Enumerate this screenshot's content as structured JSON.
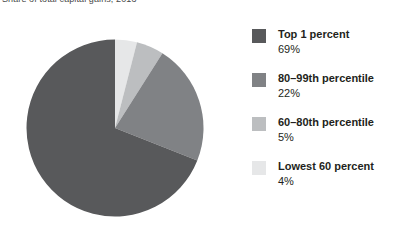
{
  "chart_data": {
    "type": "pie",
    "title": "Share of total capital gains, 2013",
    "xlabel": "",
    "ylabel": "",
    "legend_position": "right",
    "grid": false,
    "start_angle_deg": 0,
    "direction": "clockwise",
    "categories": [
      "Top 1 percent",
      "80–99th percentile",
      "60–80th percentile",
      "Lowest 60 percent"
    ],
    "values": [
      69,
      22,
      5,
      4
    ],
    "value_labels": [
      "69%",
      "22%",
      "5%",
      "4%"
    ],
    "unit": "percent",
    "colors": [
      "#58595b",
      "#808285",
      "#bcbec0",
      "#e6e7e8"
    ],
    "slices": [
      {
        "label": "Top 1 percent",
        "value": 69,
        "value_label": "69%",
        "color": "#58595b"
      },
      {
        "label": "80–99th percentile",
        "value": 22,
        "value_label": "22%",
        "color": "#808285"
      },
      {
        "label": "60–80th percentile",
        "value": 5,
        "value_label": "5%",
        "color": "#bcbec0"
      },
      {
        "label": "Lowest 60 percent",
        "value": 4,
        "value_label": "4%",
        "color": "#e6e7e8"
      }
    ]
  },
  "chart": {
    "title": "Share of total capital gains, 2013"
  },
  "legend": {
    "items": [
      {
        "label": "Top 1 percent",
        "value": "69%",
        "color": "#58595b",
        "name": "top-1-percent"
      },
      {
        "label": "80–99th percentile",
        "value": "22%",
        "color": "#808285",
        "name": "80-99th-percentile"
      },
      {
        "label": "60–80th percentile",
        "value": "5%",
        "color": "#bcbec0",
        "name": "60-80th-percentile"
      },
      {
        "label": "Lowest 60 percent",
        "value": "4%",
        "color": "#e6e7e8",
        "name": "lowest-60-percent"
      }
    ]
  }
}
